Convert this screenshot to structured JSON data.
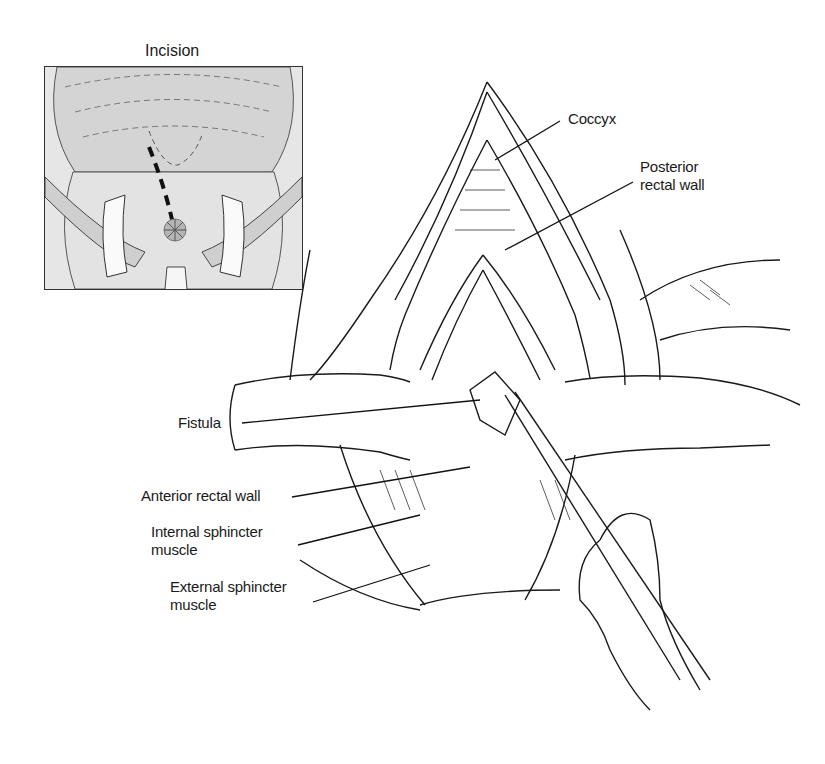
{
  "figure": {
    "inset": {
      "title": "Incision"
    },
    "labels": [
      {
        "id": "coccyx",
        "text": "Coccyx"
      },
      {
        "id": "posterior-rectal-wall",
        "text": "Posterior\nrectal wall"
      },
      {
        "id": "fistula",
        "text": "Fistula"
      },
      {
        "id": "anterior-rectal-wall",
        "text": "Anterior rectal wall"
      },
      {
        "id": "internal-sphincter",
        "text": "Internal sphincter\nmuscle"
      },
      {
        "id": "external-sphincter",
        "text": "External sphincter\nmuscle"
      }
    ],
    "caption": "(caption text cut off at bottom edge — illegible)"
  },
  "colors": {
    "ink": "#1a1a1a",
    "inset_fill": "#e6e6e6",
    "inset_shade": "#c9c9c9",
    "background": "#ffffff"
  }
}
